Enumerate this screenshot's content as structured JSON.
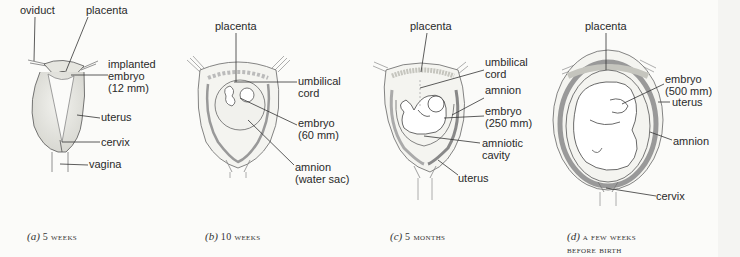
{
  "figure": {
    "panels": [
      {
        "id": "a",
        "caption_letter": "(a)",
        "caption_text": " 5 weeks",
        "labels": {
          "oviduct": "oviduct",
          "placenta": "placenta",
          "embryo": "implanted\nembryo\n(12 mm)",
          "uterus": "uterus",
          "cervix": "cervix",
          "vagina": "vagina"
        }
      },
      {
        "id": "b",
        "caption_letter": "(b)",
        "caption_text": " 10 weeks",
        "labels": {
          "placenta": "placenta",
          "umbilical_cord": "umbilical\ncord",
          "embryo": "embryo\n(60 mm)",
          "amnion": "amnion\n(water sac)"
        }
      },
      {
        "id": "c",
        "caption_letter": "(c)",
        "caption_text": " 5 months",
        "labels": {
          "placenta": "placenta",
          "umbilical_cord": "umbilical\ncord",
          "amnion": "amnion",
          "embryo": "embryo\n(250 mm)",
          "amniotic_cavity": "amniotic\ncavity",
          "uterus": "uterus"
        }
      },
      {
        "id": "d",
        "caption_letter": "(d)",
        "caption_text": " a few weeks\nbefore birth",
        "labels": {
          "placenta": "placenta",
          "embryo": "embryo\n(500 mm)",
          "uterus": "uterus",
          "amnion": "amnion",
          "cervix": "cervix"
        }
      }
    ]
  }
}
